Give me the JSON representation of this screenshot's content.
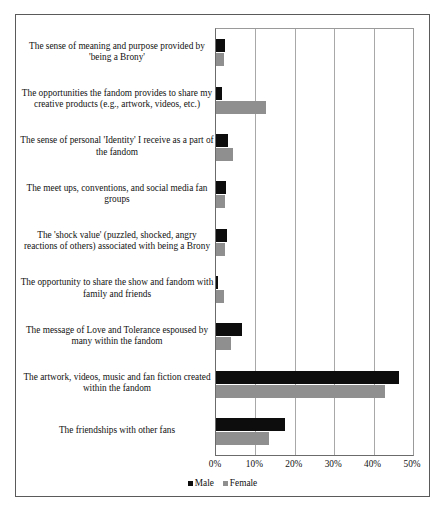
{
  "chart_data": {
    "type": "bar",
    "orientation": "horizontal",
    "title": "",
    "xlabel": "",
    "ylabel": "",
    "xlim": [
      0,
      50
    ],
    "xticks": [
      "0%",
      "10%",
      "20%",
      "30%",
      "40%",
      "50%"
    ],
    "xtick_values": [
      0,
      10,
      20,
      30,
      40,
      50
    ],
    "grid": true,
    "legend_position": "bottom",
    "categories": [
      "The sense of meaning and purpose provided by 'being a Brony'",
      "The opportunities the fandom provides to share my creative products (e.g., artwork, videos, etc.)",
      "The sense of personal 'Identity' I receive as a part of the fandom",
      "The meet ups, conventions, and social media fan groups",
      "The 'shock value' (puzzled, shocked, angry reactions of others) associated with being a Brony",
      "The opportunity to share the show and fandom with family and friends",
      "The message of Love and Tolerance espoused by many within the fandom",
      "The artwork, videos, music and fan fiction created within the fandom",
      "The friendships with other fans"
    ],
    "series": [
      {
        "name": "Male",
        "color": "#0d0d0d",
        "values": [
          2.3,
          1.6,
          3.1,
          2.6,
          2.8,
          0.6,
          6.5,
          46.5,
          17.5
        ]
      },
      {
        "name": "Female",
        "color": "#8f8f8f",
        "values": [
          2.0,
          12.7,
          4.3,
          2.3,
          2.3,
          2.0,
          3.8,
          43.0,
          13.5
        ]
      }
    ]
  }
}
